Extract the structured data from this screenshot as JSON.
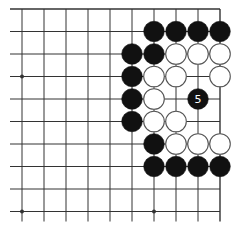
{
  "diagram": {
    "type": "go-board-fragment",
    "grid": {
      "cols": 10,
      "rows": 10,
      "x0": 22,
      "dx": 22,
      "y0": 9,
      "dy": 22.5,
      "edges": {
        "top": true,
        "right": true,
        "left": false,
        "bottom": false
      }
    },
    "colors": {
      "background": "#ffffff",
      "line": "#333333",
      "black_stone": "#111111",
      "white_stone_fill": "#ffffff",
      "white_stone_stroke": "#555555",
      "label_on_black": "#ffffff"
    },
    "star_points": [
      [
        0,
        3
      ],
      [
        0,
        9
      ],
      [
        6,
        9
      ]
    ],
    "stones": [
      {
        "c": 6,
        "r": 1,
        "color": "black"
      },
      {
        "c": 7,
        "r": 1,
        "color": "black"
      },
      {
        "c": 8,
        "r": 1,
        "color": "black"
      },
      {
        "c": 9,
        "r": 1,
        "color": "black"
      },
      {
        "c": 5,
        "r": 2,
        "color": "black"
      },
      {
        "c": 6,
        "r": 2,
        "color": "black"
      },
      {
        "c": 7,
        "r": 2,
        "color": "white"
      },
      {
        "c": 8,
        "r": 2,
        "color": "white"
      },
      {
        "c": 9,
        "r": 2,
        "color": "white"
      },
      {
        "c": 5,
        "r": 3,
        "color": "black"
      },
      {
        "c": 6,
        "r": 3,
        "color": "white"
      },
      {
        "c": 7,
        "r": 3,
        "color": "white"
      },
      {
        "c": 9,
        "r": 3,
        "color": "white"
      },
      {
        "c": 5,
        "r": 4,
        "color": "black"
      },
      {
        "c": 6,
        "r": 4,
        "color": "white"
      },
      {
        "c": 8,
        "r": 4,
        "color": "black",
        "label": "5"
      },
      {
        "c": 5,
        "r": 5,
        "color": "black"
      },
      {
        "c": 6,
        "r": 5,
        "color": "white"
      },
      {
        "c": 7,
        "r": 5,
        "color": "white"
      },
      {
        "c": 6,
        "r": 6,
        "color": "black"
      },
      {
        "c": 7,
        "r": 6,
        "color": "white"
      },
      {
        "c": 8,
        "r": 6,
        "color": "white"
      },
      {
        "c": 9,
        "r": 6,
        "color": "white"
      },
      {
        "c": 6,
        "r": 7,
        "color": "black"
      },
      {
        "c": 7,
        "r": 7,
        "color": "black"
      },
      {
        "c": 8,
        "r": 7,
        "color": "black"
      },
      {
        "c": 9,
        "r": 7,
        "color": "black"
      }
    ],
    "move_labels": [
      "5"
    ]
  }
}
